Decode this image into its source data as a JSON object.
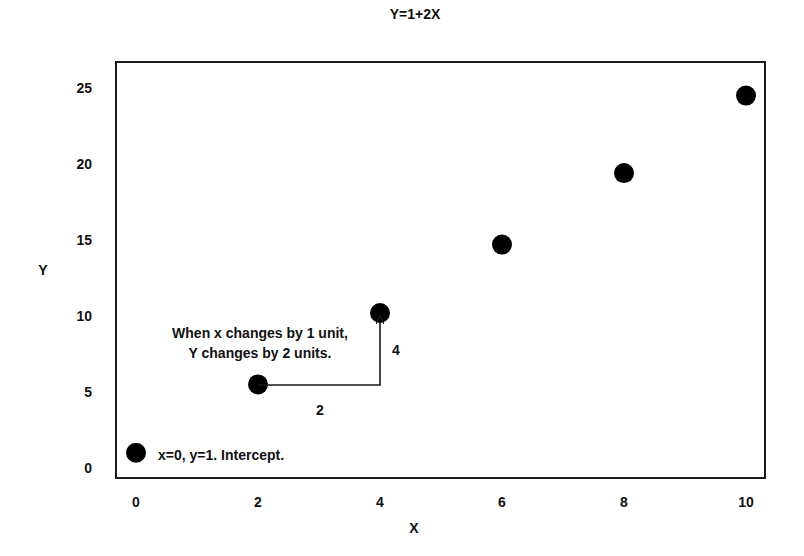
{
  "chart_data": {
    "type": "scatter",
    "title": "Y=1+2X",
    "xlabel": "X",
    "ylabel": "Y",
    "xlim": [
      0,
      10
    ],
    "ylim": [
      0,
      25
    ],
    "x_ticks": [
      "0",
      "2",
      "4",
      "6",
      "8",
      "10"
    ],
    "y_ticks": [
      "0",
      "5",
      "10",
      "15",
      "20",
      "25"
    ],
    "grid": false,
    "legend": null,
    "series": [
      {
        "name": "points",
        "color": "#000000",
        "x": [
          0,
          2,
          4,
          6,
          8,
          10
        ],
        "y": [
          1,
          5.5,
          10.2,
          14.7,
          19.4,
          24.5
        ]
      }
    ],
    "annotations": [
      {
        "text": "x=0, y=1. Intercept.",
        "x": 0,
        "y": 1
      },
      {
        "text_line1": "When x changes by 1 unit,",
        "text_line2": "Y changes by 2 units.",
        "x": 2,
        "y": 8
      },
      {
        "text": "2",
        "type": "run-label"
      },
      {
        "text": "4",
        "type": "rise-label"
      }
    ]
  },
  "title": "Y=1+2X",
  "axes": {
    "xlabel": "X",
    "ylabel": "Y",
    "x_ticks": [
      {
        "label": "0",
        "px": 136
      },
      {
        "label": "2",
        "px": 258
      },
      {
        "label": "4",
        "px": 380
      },
      {
        "label": "6",
        "px": 502
      },
      {
        "label": "8",
        "px": 624
      },
      {
        "label": "10",
        "px": 746
      }
    ],
    "y_ticks": [
      {
        "label": "25",
        "py": 88
      },
      {
        "label": "20",
        "py": 164
      },
      {
        "label": "15",
        "py": 240
      },
      {
        "label": "10",
        "py": 316
      },
      {
        "label": "5",
        "py": 392
      },
      {
        "label": "0",
        "py": 468
      }
    ]
  },
  "annotations": {
    "intercept": "x=0, y=1. Intercept.",
    "slope_line1": "When x changes by 1 unit,",
    "slope_line2": "Y changes by 2 units.",
    "run": "2",
    "rise": "4"
  }
}
